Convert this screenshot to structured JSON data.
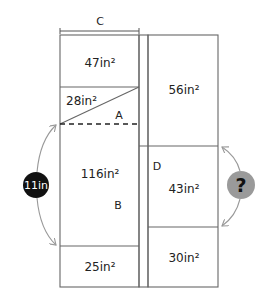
{
  "diagram": {
    "dimension_c": {
      "label": "C"
    },
    "regions": {
      "top_left": {
        "area": "47in²"
      },
      "triangle": {
        "area": "28in²"
      },
      "label_a": "A",
      "middle_left": {
        "area": "116in²"
      },
      "label_b": "B",
      "bottom_left": {
        "area": "25in²"
      },
      "top_right": {
        "area": "56in²"
      },
      "label_d": "D",
      "middle_right": {
        "area": "43in²"
      },
      "bottom_right": {
        "area": "30in²"
      }
    },
    "left_measure": {
      "label": "11in",
      "color": "#111111"
    },
    "right_measure": {
      "label": "?",
      "color": "#9a9a9a"
    }
  }
}
